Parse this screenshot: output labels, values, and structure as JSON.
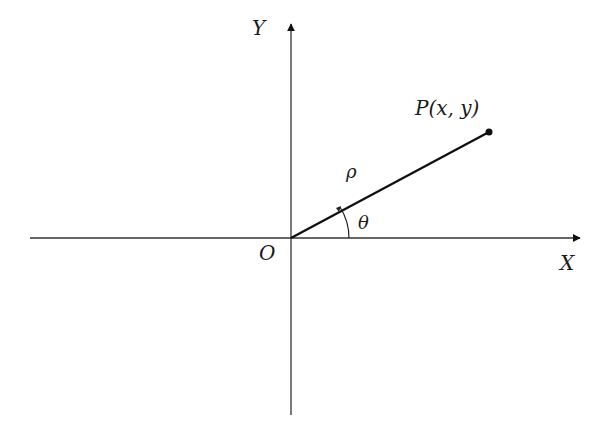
{
  "diagram": {
    "type": "polar-coordinates",
    "origin_label": "O",
    "x_axis_label": "X",
    "y_axis_label": "Y",
    "point_label": "P(x, y)",
    "radius_label": "ρ",
    "angle_label": "θ",
    "colors": {
      "stroke": "#111111",
      "background": "#ffffff"
    }
  }
}
